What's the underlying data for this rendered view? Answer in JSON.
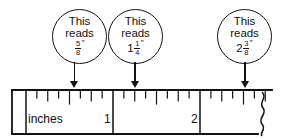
{
  "diagram": {
    "callouts": [
      {
        "id": "callout-1",
        "line1": "This",
        "line2": "reads",
        "whole": "",
        "numerator": "5",
        "denominator": "8",
        "inch_mark": "″",
        "value_text": "5/8″",
        "points_to_inches": 0.625,
        "circle": {
          "x": 52,
          "y": 9,
          "d": 55
        },
        "arrow": {
          "x": 74.5,
          "y": 62,
          "h": 26
        }
      },
      {
        "id": "callout-2",
        "line1": "This",
        "line2": "reads",
        "whole": "1",
        "numerator": "1",
        "denominator": "4",
        "inch_mark": "″",
        "value_text": "1 1/4″",
        "points_to_inches": 1.25,
        "circle": {
          "x": 108,
          "y": 9,
          "d": 55
        },
        "arrow": {
          "x": 135,
          "y": 62,
          "h": 26
        }
      },
      {
        "id": "callout-3",
        "line1": "This",
        "line2": "reads",
        "whole": "2",
        "numerator": "3",
        "denominator": "8",
        "inch_mark": "″",
        "value_text": "2 3/8″",
        "points_to_inches": 2.375,
        "circle": {
          "x": 217,
          "y": 9,
          "d": 55
        },
        "arrow": {
          "x": 245,
          "y": 62,
          "h": 26
        }
      }
    ],
    "ruler": {
      "unit_label": "inches",
      "inch_labels": [
        "1",
        "2"
      ],
      "origin_x": 26,
      "inch_width": 87,
      "top_y": 90,
      "bottom_y": 134,
      "subdivisions_per_inch": 8,
      "has_break_symbol": true,
      "break_symbol": "squiggle",
      "tick_heights": {
        "inch": 26,
        "half": 14,
        "quarter": 11,
        "eighth": 8
      }
    },
    "colors": {
      "ink": "#111111",
      "background": "#ffffff"
    }
  }
}
